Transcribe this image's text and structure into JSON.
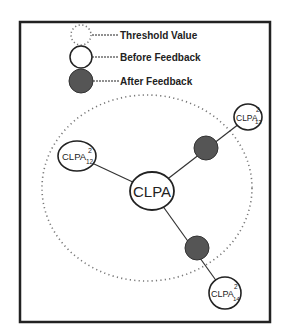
{
  "legend": {
    "items": [
      {
        "key": "threshold",
        "label": "Threshold Value",
        "style": "dotted"
      },
      {
        "key": "before",
        "label": "Before Feedback",
        "style": "hollow"
      },
      {
        "key": "after",
        "label": "After Feedback",
        "style": "filled"
      }
    ]
  },
  "colors": {
    "stroke": "#222222",
    "filled_node": "#555555",
    "dotted": "#777777",
    "background": "#ffffff"
  },
  "nodes": {
    "center": {
      "label": "CLPA"
    },
    "top_right": {
      "base": "CLPA",
      "sup": "2",
      "sub": "13"
    },
    "left": {
      "base": "CLPA",
      "sup": "2",
      "sub": "12"
    },
    "bottom": {
      "base": "CLPA",
      "sup": "2",
      "sub": "14"
    }
  }
}
